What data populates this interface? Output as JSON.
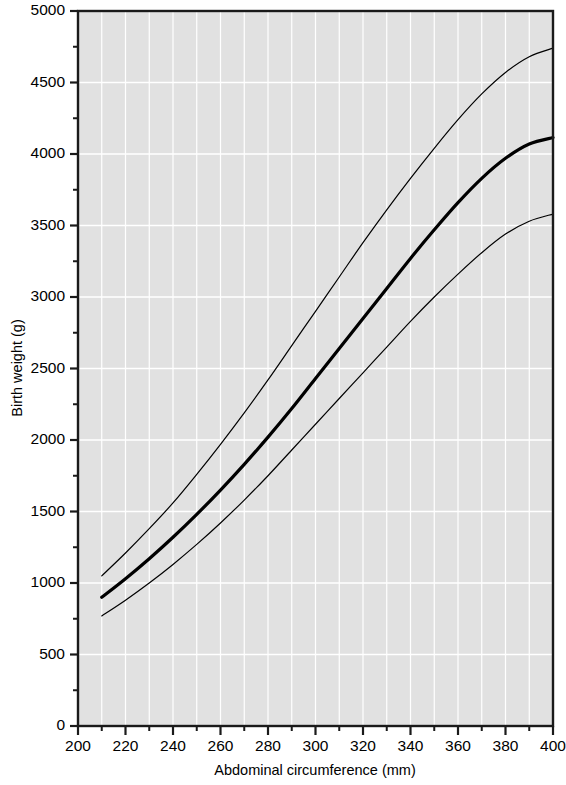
{
  "chart_data": {
    "type": "line",
    "title": "",
    "xlabel": "Abdominal circumference (mm)",
    "ylabel": "Birth weight (g)",
    "xlim": [
      200,
      400
    ],
    "ylim": [
      0,
      5000
    ],
    "grid": true,
    "legend_position": "none",
    "plot_background": "#e1e1e1",
    "gridline_color": "#ffffff",
    "line_color": "#000000",
    "x_major_ticks": [
      200,
      220,
      240,
      260,
      280,
      300,
      320,
      340,
      360,
      380,
      400
    ],
    "x_minor_ticks": [
      210,
      230,
      250,
      270,
      290,
      310,
      330,
      350,
      370,
      390
    ],
    "y_major_ticks": [
      0,
      500,
      1000,
      1500,
      2000,
      2500,
      3000,
      3500,
      4000,
      4500,
      5000
    ],
    "y_minor_ticks": [
      250,
      750,
      1250,
      1750,
      2250,
      2750,
      3250,
      3750,
      4250,
      4750
    ],
    "x": [
      210,
      220,
      230,
      240,
      250,
      260,
      270,
      280,
      290,
      300,
      310,
      320,
      330,
      340,
      350,
      360,
      370,
      380,
      390,
      400
    ],
    "series": [
      {
        "name": "Upper limit",
        "line_width": 1.2,
        "values": [
          1050,
          1210,
          1380,
          1560,
          1760,
          1970,
          2190,
          2420,
          2660,
          2900,
          3140,
          3380,
          3610,
          3830,
          4040,
          4240,
          4420,
          4570,
          4680,
          4740
        ]
      },
      {
        "name": "Median",
        "line_width": 3.2,
        "values": [
          900,
          1030,
          1170,
          1320,
          1480,
          1650,
          1830,
          2020,
          2220,
          2430,
          2640,
          2850,
          3060,
          3270,
          3470,
          3660,
          3830,
          3970,
          4070,
          4115
        ]
      },
      {
        "name": "Lower limit",
        "line_width": 1.2,
        "values": [
          770,
          880,
          1000,
          1130,
          1270,
          1420,
          1580,
          1750,
          1930,
          2110,
          2290,
          2470,
          2650,
          2830,
          3000,
          3160,
          3310,
          3440,
          3530,
          3580
        ]
      }
    ]
  }
}
